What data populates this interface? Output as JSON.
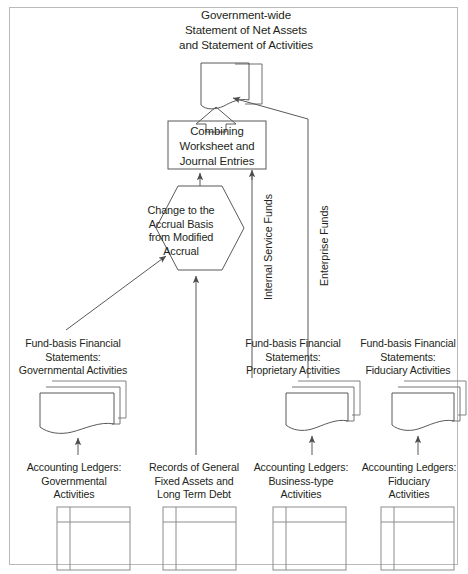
{
  "diagram": {
    "title_top": "Government-wide\nStatement of Net Assets\nand Statement of Activities",
    "worksheet_box": "Combining\nWorksheet and\nJournal Entries",
    "hexagon": "Change to the\nAccrual Basis\nfrom Modified\nAccrual",
    "flow_labels": {
      "internal_service": "Internal Service Funds",
      "enterprise": "Enterprise Funds"
    },
    "fund_basis": [
      {
        "key": "governmental",
        "text": "Fund-basis Financial\nStatements:\nGovernmental Activities"
      },
      {
        "key": "proprietary",
        "text": "Fund-basis Financial\nStatements:\nProprietary Activities"
      },
      {
        "key": "fiduciary",
        "text": "Fund-basis Financial\nStatements:\nFiduciary Activities"
      }
    ],
    "ledgers": [
      {
        "key": "governmental",
        "text": "Accounting Ledgers:\nGovernmental\nActivities"
      },
      {
        "key": "fixed_assets",
        "text": "Records of General\nFixed Assets and\nLong Term Debt"
      },
      {
        "key": "business_type",
        "text": "Accounting Ledgers:\nBusiness-type\nActivities"
      },
      {
        "key": "fiduciary",
        "text": "Accounting Ledgers:\nFiduciary\nActivities"
      }
    ],
    "colors": {
      "text": "#231f20",
      "stroke": "#58595b",
      "frame": "#b9b9b9",
      "background": "#ffffff"
    },
    "icons": {
      "top_document": "document-curled-page-icon",
      "stacked_documents": "stacked-documents-icon",
      "ledger_book": "ledger-table-icon",
      "hexagon": "hexagon-process-icon",
      "block_arrow": "block-arrow-up-icon"
    }
  }
}
